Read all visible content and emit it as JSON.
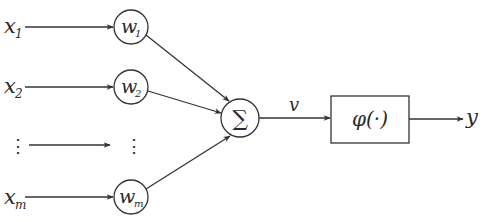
{
  "diagram": {
    "title": "",
    "type": "perceptron-neuron-model",
    "inputs": [
      {
        "label": "x",
        "sub": "1"
      },
      {
        "label": "x",
        "sub": "2"
      },
      {
        "label": "⋮",
        "sub": ""
      },
      {
        "label": "x",
        "sub": "m"
      }
    ],
    "weights": [
      {
        "label": "w",
        "sub": "1"
      },
      {
        "label": "w",
        "sub": "2"
      },
      {
        "label": "⋮",
        "sub": ""
      },
      {
        "label": "w",
        "sub": "m"
      }
    ],
    "summation": {
      "symbol": "∑"
    },
    "induced_field": {
      "label": "v"
    },
    "activation": {
      "label": "φ(·)"
    },
    "output": {
      "label": "y"
    },
    "colors": {
      "stroke": "#333333",
      "text": "#2a2a2a",
      "background": "#ffffff"
    }
  }
}
